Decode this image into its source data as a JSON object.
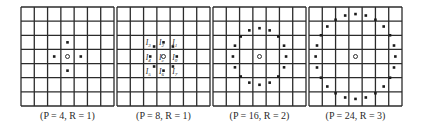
{
  "figure": {
    "grid": {
      "rows": 7,
      "cols": 7,
      "line_color": "#2b2b2b",
      "dot_color": "#1a1a1a"
    },
    "panels": [
      {
        "caption": "(P = 4, R = 1)",
        "P": 4,
        "R": 1,
        "left": 21
      },
      {
        "caption": "(P = 8, R = 1)",
        "P": 8,
        "R": 1,
        "left": 117,
        "labels": [
          {
            "text": "I",
            "sub": "0",
            "pos": "right"
          },
          {
            "text": "I",
            "sub": "1",
            "pos": "top-right"
          },
          {
            "text": "I",
            "sub": "2",
            "pos": "top"
          },
          {
            "text": "I",
            "sub": "3",
            "pos": "top-left"
          },
          {
            "text": "I",
            "sub": "4",
            "pos": "left"
          },
          {
            "text": "I",
            "sub": "5",
            "pos": "bottom-left"
          },
          {
            "text": "I",
            "sub": "6",
            "pos": "bottom"
          },
          {
            "text": "I",
            "sub": "7",
            "pos": "bottom-right"
          },
          {
            "text": "I",
            "sub": "c",
            "pos": "center"
          }
        ]
      },
      {
        "caption": "(P = 16, R = 2)",
        "P": 16,
        "R": 2,
        "left": 213
      },
      {
        "caption": "(P = 24, R = 3)",
        "P": 24,
        "R": 3,
        "left": 309
      }
    ]
  }
}
